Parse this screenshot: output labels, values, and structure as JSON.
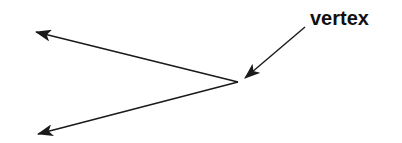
{
  "diagram": {
    "label": "vertex",
    "stroke_color": "#1a1a1a",
    "vertex": {
      "x": 238,
      "y": 82
    },
    "rays": [
      {
        "name": "upper-ray",
        "to": {
          "x": 36,
          "y": 32
        }
      },
      {
        "name": "lower-ray",
        "to": {
          "x": 38,
          "y": 134
        }
      }
    ],
    "label_pointer": {
      "from": {
        "x": 305,
        "y": 27
      },
      "to": {
        "x": 245,
        "y": 78
      }
    }
  }
}
